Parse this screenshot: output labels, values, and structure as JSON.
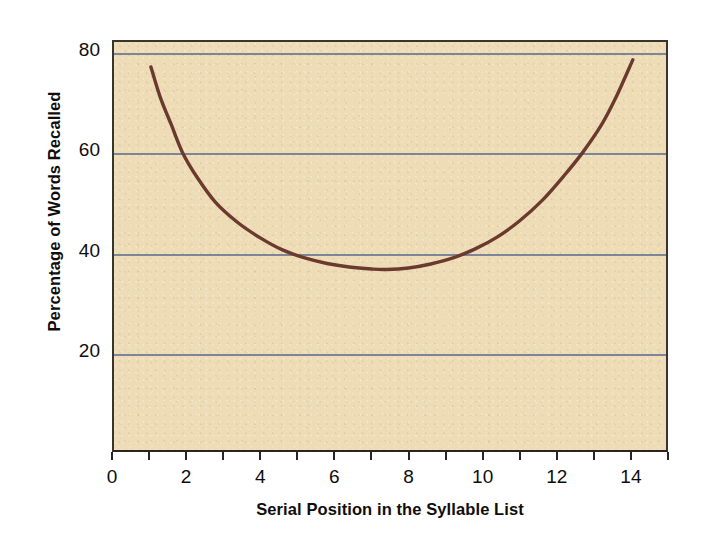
{
  "chart_data": {
    "type": "line",
    "title": "",
    "subtitle": "",
    "xlabel": "Serial Position in the Syllable List",
    "ylabel": "Percentage of Words Recalled",
    "xlim": [
      0,
      15
    ],
    "ylim": [
      0,
      83
    ],
    "grid": true,
    "legend": false,
    "x_ticks": [
      0,
      1,
      2,
      3,
      4,
      5,
      6,
      7,
      8,
      9,
      10,
      11,
      12,
      13,
      14,
      15
    ],
    "x_tick_labels": [
      "0",
      "",
      "2",
      "",
      "4",
      "",
      "6",
      "",
      "8",
      "",
      "10",
      "",
      "12",
      "",
      "14",
      ""
    ],
    "y_ticks": [
      20,
      40,
      60,
      80
    ],
    "y_tick_labels": [
      "20",
      "40",
      "60",
      "80"
    ],
    "series": [
      {
        "name": "Percentage of Words Recalled",
        "color": "#6b3a2e",
        "x": [
          1.05,
          1.3,
          1.6,
          1.9,
          2.3,
          2.8,
          3.4,
          4.0,
          4.6,
          5.2,
          5.8,
          6.4,
          7.0,
          7.4,
          8.0,
          8.6,
          9.2,
          9.8,
          10.4,
          11.0,
          11.6,
          12.2,
          12.7,
          13.2,
          13.6,
          14.05
        ],
        "y": [
          77.0,
          71.0,
          65.5,
          60.0,
          55.0,
          50.0,
          46.0,
          43.0,
          40.6,
          39.0,
          37.9,
          37.2,
          36.8,
          36.7,
          37.0,
          37.8,
          39.0,
          40.8,
          43.2,
          46.4,
          50.4,
          55.4,
          60.0,
          65.4,
          71.0,
          78.4
        ]
      }
    ],
    "annotations": []
  },
  "axes": {
    "y_title": "Percentage of Words Recalled",
    "x_title": "Serial Position in the Syllable List"
  },
  "colors": {
    "plot_background": "#eedcb6",
    "curve": "#6b3a2e",
    "gridline": "#7d8598",
    "axis": "#2a2520",
    "text": "#100d0c",
    "page_background": "#ffffff"
  }
}
